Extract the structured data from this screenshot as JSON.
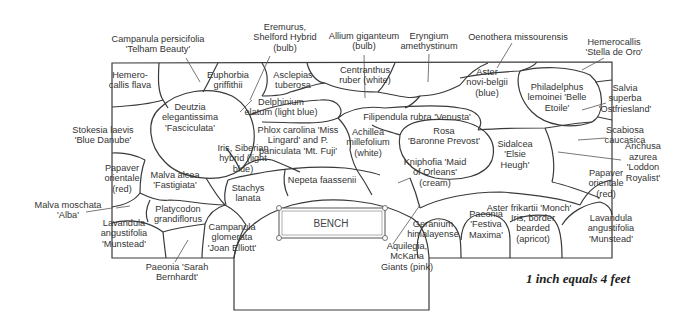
{
  "diagram": {
    "type": "garden-planting-plan",
    "scale_note": "1 inch equals 4 feet",
    "bench_label": "BENCH",
    "plants": [
      {
        "id": "campanula-persicifolia",
        "lines": [
          "Campanula persicifolia",
          "'Telham Beauty'"
        ],
        "x": 158,
        "y": 44
      },
      {
        "id": "eremurus",
        "lines": [
          "Eremurus,",
          "Shelford Hybrid",
          "(bulb)"
        ],
        "x": 285,
        "y": 37
      },
      {
        "id": "allium-giganteum",
        "lines": [
          "Allium giganteum",
          "(bulb)"
        ],
        "x": 364,
        "y": 41
      },
      {
        "id": "eryngium",
        "lines": [
          "Eryngium",
          "amethystinum"
        ],
        "x": 429,
        "y": 41
      },
      {
        "id": "oenothera",
        "lines": [
          "Oenothera missourensis"
        ],
        "x": 518,
        "y": 37
      },
      {
        "id": "hemerocallis-stella",
        "lines": [
          "Hemerocallis",
          "'Stella de Oro'"
        ],
        "x": 614,
        "y": 47
      },
      {
        "id": "hemerocallis-flava",
        "lines": [
          "Hemero-",
          "callis flava"
        ],
        "x": 130,
        "y": 80
      },
      {
        "id": "euphorbia",
        "lines": [
          "Euphorbia",
          "griffithii"
        ],
        "x": 228,
        "y": 80
      },
      {
        "id": "asclepias",
        "lines": [
          "Asclepias",
          "tuberosa"
        ],
        "x": 293,
        "y": 80
      },
      {
        "id": "centranthus",
        "lines": [
          "Centranthus",
          "ruber (white)"
        ],
        "x": 365,
        "y": 75
      },
      {
        "id": "aster-novi-belgii",
        "lines": [
          "Aster",
          "novi-belgii",
          "(blue)"
        ],
        "x": 487,
        "y": 82
      },
      {
        "id": "philadelphus",
        "lines": [
          "Philadelphus",
          "lemoinei 'Belle",
          "Etoile'"
        ],
        "x": 557,
        "y": 97
      },
      {
        "id": "salvia",
        "lines": [
          "Salvia",
          "superba",
          "'Ostfriesland'"
        ],
        "x": 625,
        "y": 98
      },
      {
        "id": "delphinium",
        "lines": [
          "Delphinium",
          "elatum (light blue)"
        ],
        "x": 281,
        "y": 107
      },
      {
        "id": "deutzia",
        "lines": [
          "Deutzia",
          "elegantissima",
          "'Fasciculata'"
        ],
        "x": 190,
        "y": 117
      },
      {
        "id": "filipendula",
        "lines": [
          "Filipendula rubra 'Venusta'"
        ],
        "x": 417,
        "y": 117
      },
      {
        "id": "stokesia",
        "lines": [
          "Stokesia laevis",
          "'Blue Danube'"
        ],
        "x": 103,
        "y": 135
      },
      {
        "id": "scabiosa",
        "lines": [
          "Scabiosa",
          "caucasica"
        ],
        "x": 625,
        "y": 135
      },
      {
        "id": "phlox",
        "lines": [
          "Phlox carolina 'Miss",
          "Lingard' and P.",
          "paniculata 'Mt. Fuji'"
        ],
        "x": 298,
        "y": 140
      },
      {
        "id": "achillea",
        "lines": [
          "Achillea",
          "millefolium",
          "(white)"
        ],
        "x": 368,
        "y": 142
      },
      {
        "id": "rosa",
        "lines": [
          "Rosa",
          "'Baronne Prevost'"
        ],
        "x": 444,
        "y": 136
      },
      {
        "id": "sidalcea",
        "lines": [
          "Sidalcea",
          "'Elsie",
          "Heugh'"
        ],
        "x": 515,
        "y": 154
      },
      {
        "id": "iris-siberian",
        "lines": [
          "Iris, Siberian",
          "hybrid (light",
          "blue)"
        ],
        "x": 243,
        "y": 158
      },
      {
        "id": "kniphofia",
        "lines": [
          "Kniphofia 'Maid",
          "of Orleans'",
          "(cream)"
        ],
        "x": 435,
        "y": 172
      },
      {
        "id": "anchusa",
        "lines": [
          "Anchusa",
          "azurea",
          "'Loddon",
          "Royalist'"
        ],
        "x": 643,
        "y": 162
      },
      {
        "id": "papaver-left",
        "lines": [
          "Papaver",
          "orientale",
          "(red)"
        ],
        "x": 122,
        "y": 178
      },
      {
        "id": "malva-alcea",
        "lines": [
          "Malva alcea",
          "'Fastigiata'"
        ],
        "x": 175,
        "y": 180
      },
      {
        "id": "nepeta",
        "lines": [
          "Nepeta faassenii"
        ],
        "x": 322,
        "y": 180
      },
      {
        "id": "stachys",
        "lines": [
          "Stachys",
          "lanata"
        ],
        "x": 248,
        "y": 193
      },
      {
        "id": "papaver-right",
        "lines": [
          "Papaver",
          "orientale",
          "(red)"
        ],
        "x": 606,
        "y": 183
      },
      {
        "id": "aster-frikartii",
        "lines": [
          "Aster frikartii 'Monch'"
        ],
        "x": 529,
        "y": 208
      },
      {
        "id": "malva-moschata",
        "lines": [
          "Malva moschata",
          "'Alba'"
        ],
        "x": 68,
        "y": 210
      },
      {
        "id": "platycodon",
        "lines": [
          "Platycodon",
          "grandiflorus"
        ],
        "x": 178,
        "y": 214
      },
      {
        "id": "geranium",
        "lines": [
          "Geranium",
          "himalayense"
        ],
        "x": 433,
        "y": 229
      },
      {
        "id": "paeonia-festiva",
        "lines": [
          "Paeonia",
          "'Festiva",
          "Maxima'"
        ],
        "x": 486,
        "y": 224
      },
      {
        "id": "iris-border",
        "lines": [
          "Iris, border",
          "bearded",
          "(apricot)"
        ],
        "x": 533,
        "y": 228
      },
      {
        "id": "lavandula-left",
        "lines": [
          "Lavandula",
          "angustifolia",
          "'Munstead'"
        ],
        "x": 124,
        "y": 233
      },
      {
        "id": "campanula-glomerata",
        "lines": [
          "Campanula",
          "glomerata",
          "'Joan Elliott'"
        ],
        "x": 232,
        "y": 237
      },
      {
        "id": "lavandula-right",
        "lines": [
          "Lavandula",
          "angustifolia",
          "'Munstead'"
        ],
        "x": 611,
        "y": 228
      },
      {
        "id": "aquilegia",
        "lines": [
          "Aquilegia,",
          "McKana",
          "Giants (pink)"
        ],
        "x": 407,
        "y": 256
      },
      {
        "id": "paeonia-sarah",
        "lines": [
          "Paeonia 'Sarah",
          "Bernhardt'"
        ],
        "x": 177,
        "y": 272
      }
    ]
  }
}
